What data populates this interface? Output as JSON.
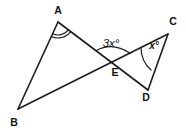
{
  "figure": {
    "type": "geometry-diagram",
    "background_color": "#ffffff",
    "line_color": "#1c1c1c",
    "points": {
      "A": "A",
      "B": "B",
      "C": "C",
      "D": "D",
      "E": "E"
    },
    "segments": [
      "AB",
      "AD",
      "BC",
      "CD"
    ],
    "angle_labels": {
      "at_E": "3x°",
      "at_C": "x°"
    },
    "angle_marks": {
      "at_A": "double-arc",
      "at_E": "single-arc",
      "at_C": "single-arc"
    }
  }
}
